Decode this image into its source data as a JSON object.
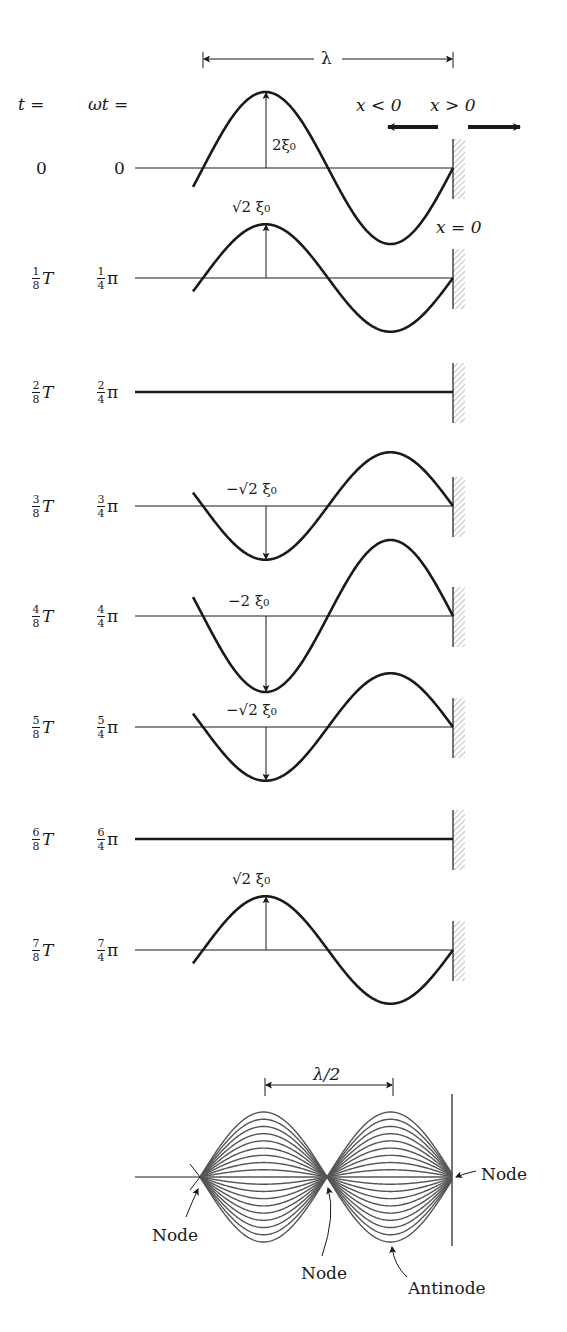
{
  "figure": {
    "header": {
      "t_label": "t =",
      "wt_label": "ωt =",
      "wavelength_label": "λ",
      "left_dir_label": "x < 0",
      "right_dir_label": "x > 0",
      "wall_label": "x = 0"
    },
    "geometry": {
      "wall_x": 453,
      "wavelength_px": 250,
      "curve_start_x": 193,
      "axis_start_x": 135,
      "max_amplitude_px": 76
    },
    "rows": [
      {
        "t_num": "",
        "t_den": "",
        "t_text": "0",
        "wt_num": "",
        "wt_den": "",
        "wt_text": "0",
        "axis_y": 168,
        "phase_frac": 0,
        "amp_label": "2ξ₀"
      },
      {
        "t_num": "1",
        "t_den": "8",
        "t_text": "T",
        "wt_num": "1",
        "wt_den": "4",
        "wt_text": "π",
        "axis_y": 278,
        "phase_frac": 0.125,
        "amp_label": "√2 ξ₀"
      },
      {
        "t_num": "2",
        "t_den": "8",
        "t_text": "T",
        "wt_num": "2",
        "wt_den": "4",
        "wt_text": "π",
        "axis_y": 392,
        "phase_frac": 0.25,
        "amp_label": ""
      },
      {
        "t_num": "3",
        "t_den": "8",
        "t_text": "T",
        "wt_num": "3",
        "wt_den": "4",
        "wt_text": "π",
        "axis_y": 506,
        "phase_frac": 0.375,
        "amp_label": "−√2 ξ₀"
      },
      {
        "t_num": "4",
        "t_den": "8",
        "t_text": "T",
        "wt_num": "4",
        "wt_den": "4",
        "wt_text": "π",
        "axis_y": 616,
        "phase_frac": 0.5,
        "amp_label": "−2 ξ₀"
      },
      {
        "t_num": "5",
        "t_den": "8",
        "t_text": "T",
        "wt_num": "5",
        "wt_den": "4",
        "wt_text": "π",
        "axis_y": 727,
        "phase_frac": 0.625,
        "amp_label": "−√2 ξ₀"
      },
      {
        "t_num": "6",
        "t_den": "8",
        "t_text": "T",
        "wt_num": "6",
        "wt_den": "4",
        "wt_text": "π",
        "axis_y": 839,
        "phase_frac": 0.75,
        "amp_label": ""
      },
      {
        "t_num": "7",
        "t_den": "8",
        "t_text": "T",
        "wt_num": "7",
        "wt_den": "4",
        "wt_text": "π",
        "axis_y": 950,
        "phase_frac": 0.875,
        "amp_label": "√2 ξ₀"
      }
    ],
    "standing_wave": {
      "half_wavelength_label": "λ/2",
      "node_labels": [
        "Node",
        "Node",
        "Node"
      ],
      "antinode_label": "Antinode",
      "axis_y": 1177,
      "left_node_x": 200,
      "mid_node_x": 327,
      "right_node_x": 452,
      "amplitude_px": 65,
      "envelope_count": 9
    },
    "colors": {
      "ink": "#1a1a1a",
      "envelope": "#555555",
      "hatch": "#888888"
    }
  }
}
